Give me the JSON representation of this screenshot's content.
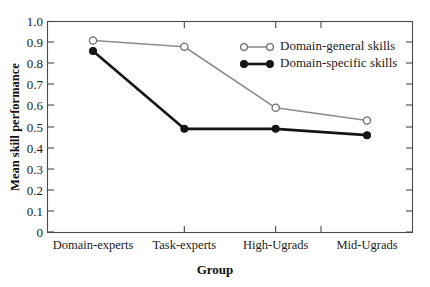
{
  "chart_data": {
    "type": "line",
    "title": "",
    "subtitle": "",
    "xlabel": "Group",
    "ylabel": "Mean skill performance",
    "categories": [
      "Domain-experts",
      "Task-experts",
      "High-Ugrads",
      "Mid-Ugrads"
    ],
    "series": [
      {
        "name": "Domain-general skills",
        "values": [
          0.91,
          0.88,
          0.59,
          0.53
        ],
        "color": "#8c8c8c",
        "marker": "open-circle"
      },
      {
        "name": "Domain-specific skills",
        "values": [
          0.86,
          0.49,
          0.49,
          0.46
        ],
        "color": "#151515",
        "marker": "filled-circle"
      }
    ],
    "ylim": [
      0,
      1.0
    ],
    "ytick_labels": [
      "0",
      "0.1",
      "0.2",
      "0.3",
      "0.4",
      "0.5",
      "0.6",
      "0.7",
      "0.8",
      "0.9",
      "1.0"
    ],
    "ytick_values": [
      0,
      0.1,
      0.2,
      0.3,
      0.4,
      0.5,
      0.6,
      0.7,
      0.8,
      0.9,
      1.0
    ],
    "grid": false,
    "legend_position": "upper-right-inside",
    "frame": "full-box",
    "tick_direction": "inward"
  },
  "legend": {
    "entries": [
      {
        "label": "Domain-general skills",
        "marker": "open-circle"
      },
      {
        "label": "Domain-specific skills",
        "marker": "filled-circle"
      }
    ]
  }
}
